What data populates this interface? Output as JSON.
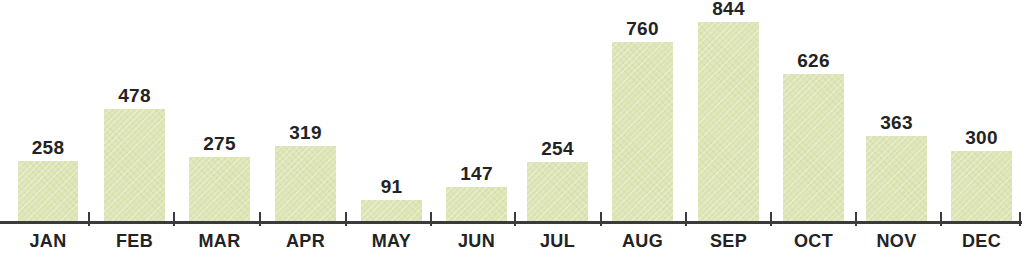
{
  "chart_data": {
    "type": "bar",
    "title": "",
    "subtitle": "",
    "xlabel": "",
    "ylabel": "",
    "categories": [
      "JAN",
      "FEB",
      "MAR",
      "APR",
      "MAY",
      "JUN",
      "JUL",
      "AUG",
      "SEP",
      "OCT",
      "NOV",
      "DEC"
    ],
    "values": [
      258,
      478,
      275,
      319,
      91,
      147,
      254,
      760,
      844,
      626,
      363,
      300
    ],
    "value_labels": [
      "258",
      "478",
      "275",
      "319",
      "91",
      "147",
      "254",
      "760",
      "844",
      "626",
      "363",
      "300"
    ],
    "series": [
      {
        "name": "",
        "values": [
          258,
          478,
          275,
          319,
          91,
          147,
          254,
          760,
          844,
          626,
          363,
          300
        ]
      }
    ],
    "ylim": [
      0,
      844
    ],
    "grid": false,
    "legend": false,
    "legend_position": "none",
    "axis": {
      "x_axis_visible": true,
      "y_axis_visible": false,
      "tick_marks": true,
      "tick_label_rotation": 0
    },
    "colors": {
      "bar_fill": "#dde5b6",
      "axis": "#3b3b3b",
      "text": "#232323",
      "background": "#ffffff"
    }
  }
}
